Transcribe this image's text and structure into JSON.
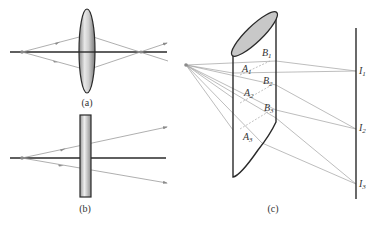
{
  "panels": {
    "a": {
      "label": "(a)",
      "element": "converging-lens",
      "source": {
        "x": 22,
        "y": 52
      },
      "image_point": {
        "x": 141,
        "y": 52
      },
      "lens": {
        "cx": 87,
        "cy": 51,
        "rx": 8,
        "ry": 42
      },
      "axis": {
        "x1": 10,
        "x2": 167,
        "y": 52
      }
    },
    "b": {
      "label": "(b)",
      "element": "flat-glass-slab",
      "source": {
        "x": 22,
        "y": 158
      },
      "slab": {
        "x": 80,
        "y": 115,
        "w": 11,
        "h": 82
      },
      "axis": {
        "x1": 10,
        "x2": 166,
        "y": 158
      }
    },
    "c": {
      "label": "(c)",
      "element": "obliquely-cut-glass-cylinder",
      "source": {
        "x": 186,
        "y": 65
      },
      "screen": {
        "x": 356,
        "y1": 28,
        "y2": 199
      },
      "points": {
        "A1": {
          "text": "A",
          "sub": "1"
        },
        "A2": {
          "text": "A",
          "sub": "2"
        },
        "A3": {
          "text": "A",
          "sub": "3"
        },
        "B1": {
          "text": "B",
          "sub": "1"
        },
        "B2": {
          "text": "B",
          "sub": "2"
        },
        "B3": {
          "text": "B",
          "sub": "3"
        },
        "I1": {
          "text": "I",
          "sub": "1"
        },
        "I2": {
          "text": "I",
          "sub": "2"
        },
        "I3": {
          "text": "I",
          "sub": "3"
        }
      }
    }
  },
  "colors": {
    "line_dark": "#2a2a2a",
    "ray": "#9a9a9a",
    "glass_fill": "#d6d6d6",
    "ellipse_fill": "#c8c8c8"
  }
}
